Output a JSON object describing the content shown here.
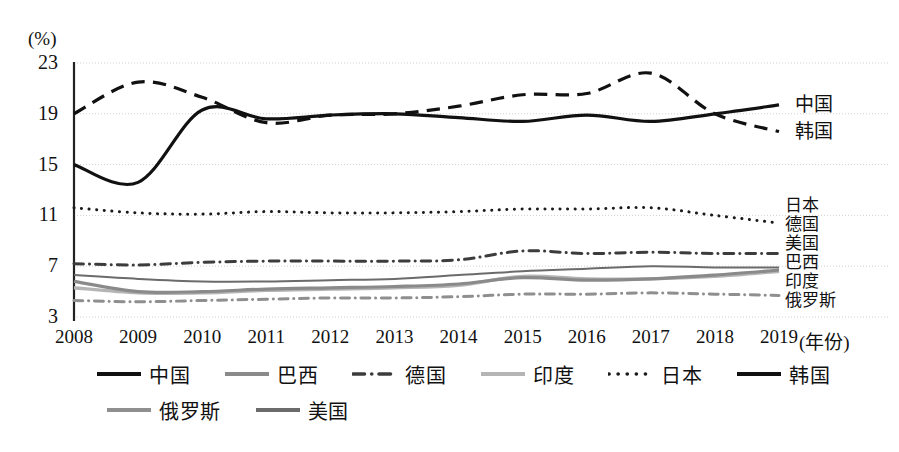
{
  "chart_data": {
    "type": "line",
    "title": "",
    "subtitle": "",
    "xlabel": "(年份)",
    "ylabel": "(%)",
    "unit_label": "(%)",
    "x": [
      2008,
      2009,
      2010,
      2011,
      2012,
      2013,
      2014,
      2015,
      2016,
      2017,
      2018,
      2019
    ],
    "categories": [
      "2008",
      "2009",
      "2010",
      "2011",
      "2012",
      "2013",
      "2014",
      "2015",
      "2016",
      "2017",
      "2018",
      "2019"
    ],
    "xlim": [
      2008,
      2019
    ],
    "ylim": [
      3,
      23
    ],
    "yticks": [
      3,
      7,
      11,
      15,
      19,
      23
    ],
    "ytick_labels": [
      "3",
      "7",
      "11",
      "15",
      "19",
      "23"
    ],
    "grid": true,
    "grid_axis": "y",
    "legend_position": "bottom",
    "series": [
      {
        "name": "中国",
        "style": "solid",
        "color": "#111111",
        "width": 3.2,
        "values": [
          15.0,
          13.6,
          19.3,
          18.6,
          18.9,
          19.0,
          18.7,
          18.4,
          18.9,
          18.4,
          19.0,
          19.7
        ],
        "end_label": "中国"
      },
      {
        "name": "韩国",
        "style": "dashed",
        "color": "#111111",
        "width": 3.2,
        "values": [
          19.0,
          21.5,
          20.3,
          18.3,
          18.9,
          19.0,
          19.6,
          20.5,
          20.6,
          22.2,
          19.0,
          17.6
        ],
        "end_label": "韩国"
      },
      {
        "name": "日本",
        "style": "dotted",
        "color": "#1a1a1a",
        "width": 3.0,
        "values": [
          11.6,
          11.2,
          11.1,
          11.3,
          11.2,
          11.2,
          11.3,
          11.5,
          11.5,
          11.6,
          11.0,
          10.4
        ],
        "end_label": "日本"
      },
      {
        "name": "德国",
        "style": "dashdot",
        "color": "#3c3c3c",
        "width": 3.0,
        "values": [
          7.2,
          7.1,
          7.3,
          7.4,
          7.4,
          7.4,
          7.5,
          8.2,
          8.0,
          8.1,
          8.0,
          8.0
        ],
        "end_label": "德国"
      },
      {
        "name": "美国",
        "style": "solid",
        "color": "#6b6b6b",
        "width": 2.0,
        "values": [
          6.3,
          6.0,
          5.8,
          5.8,
          5.9,
          6.0,
          6.3,
          6.6,
          6.8,
          7.0,
          6.9,
          6.9
        ],
        "end_label": "美国"
      },
      {
        "name": "巴西",
        "style": "solid",
        "color": "#8a8a8a",
        "width": 3.2,
        "values": [
          5.8,
          5.0,
          5.0,
          5.2,
          5.3,
          5.4,
          5.6,
          6.1,
          5.9,
          6.0,
          6.3,
          6.7
        ],
        "end_label": "巴西"
      },
      {
        "name": "印度",
        "style": "solid",
        "color": "#b5b5b5",
        "width": 3.4,
        "values": [
          5.3,
          4.9,
          4.9,
          5.1,
          5.2,
          5.3,
          5.5,
          6.2,
          6.0,
          6.0,
          6.2,
          6.6
        ],
        "end_label": "印度"
      },
      {
        "name": "俄罗斯",
        "style": "dashdot-gray",
        "color": "#8f8f8f",
        "width": 3.0,
        "values": [
          4.3,
          4.2,
          4.3,
          4.4,
          4.5,
          4.5,
          4.6,
          4.8,
          4.8,
          4.9,
          4.8,
          4.7
        ],
        "end_label": "俄罗斯"
      }
    ]
  },
  "axis": {
    "unit": "(%)",
    "x_title": "(年份)",
    "yticks": [
      "3",
      "7",
      "11",
      "15",
      "19",
      "23"
    ],
    "xticks": [
      "2008",
      "2009",
      "2010",
      "2011",
      "2012",
      "2013",
      "2014",
      "2015",
      "2016",
      "2017",
      "2018",
      "2019"
    ]
  },
  "right_labels": {
    "top": [
      "中国",
      "韩国"
    ],
    "stack": [
      "日本",
      "德国",
      "美国",
      "巴西",
      "印度",
      "俄罗斯"
    ]
  },
  "legend": {
    "rows": [
      [
        {
          "label": "中国",
          "style": "solid",
          "color": "#111111"
        },
        {
          "label": "巴西",
          "style": "solid",
          "color": "#8a8a8a"
        },
        {
          "label": "德国",
          "style": "dashdot",
          "color": "#3c3c3c"
        },
        {
          "label": "印度",
          "style": "solid",
          "color": "#b5b5b5"
        },
        {
          "label": "日本",
          "style": "dotted",
          "color": "#1a1a1a"
        },
        {
          "label": "韩国",
          "style": "solid",
          "color": "#111111"
        }
      ],
      [
        {
          "label": "俄罗斯",
          "style": "solid",
          "color": "#8f8f8f"
        },
        {
          "label": "美国",
          "style": "solid",
          "color": "#6b6b6b"
        }
      ]
    ]
  },
  "colors": {
    "axis": "#222222",
    "grid": "#cfcfcf",
    "background": "#ffffff"
  }
}
